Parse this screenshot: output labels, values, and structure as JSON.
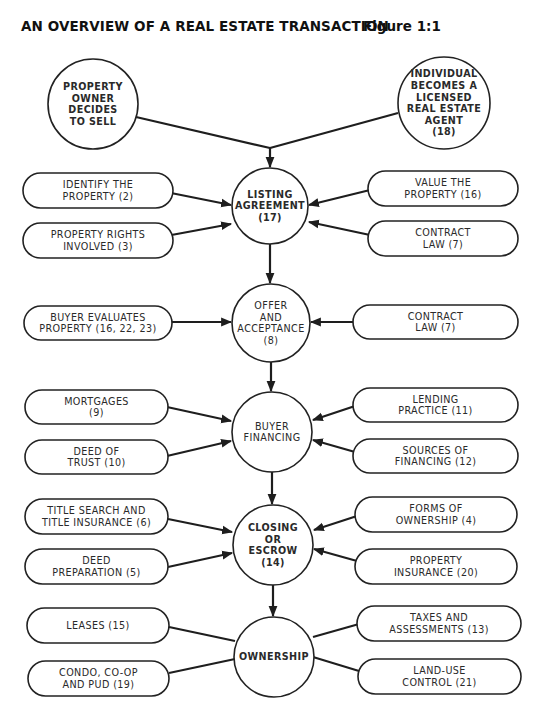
{
  "header": {
    "title": "AN OVERVIEW OF A REAL ESTATE TRANSACTION",
    "figure": "Figure 1:1"
  },
  "colors": {
    "stroke": "#222222",
    "text": "#2a2a2a",
    "background": "#ffffff"
  },
  "circles": [
    {
      "id": "property-owner-decides-to-sell",
      "cx": 93,
      "cy": 104,
      "r": 45,
      "bold": true,
      "lines": [
        "PROPERTY",
        "OWNER",
        "DECIDES",
        "TO SELL"
      ]
    },
    {
      "id": "individual-becomes-licensed-agent",
      "cx": 444,
      "cy": 103,
      "r": 46,
      "bold": true,
      "lines": [
        "INDIVIDUAL",
        "BECOMES A",
        "LICENSED",
        "REAL ESTATE",
        "AGENT",
        "(18)"
      ]
    },
    {
      "id": "listing-agreement",
      "cx": 270,
      "cy": 206,
      "r": 38,
      "bold": true,
      "lines": [
        "LISTING",
        "AGREEMENT",
        "(17)"
      ]
    },
    {
      "id": "offer-and-acceptance",
      "cx": 271,
      "cy": 323,
      "r": 39,
      "bold": false,
      "lines": [
        "OFFER",
        "AND",
        "ACCEPTANCE",
        "(8)"
      ]
    },
    {
      "id": "buyer-financing",
      "cx": 272,
      "cy": 432,
      "r": 40,
      "bold": false,
      "lines": [
        "BUYER",
        "FINANCING"
      ]
    },
    {
      "id": "closing-or-escrow",
      "cx": 273,
      "cy": 545,
      "r": 40,
      "bold": true,
      "lines": [
        "CLOSING",
        "OR",
        "ESCROW",
        "(14)"
      ]
    },
    {
      "id": "ownership",
      "cx": 274,
      "cy": 657,
      "r": 40,
      "bold": true,
      "lines": [
        "OWNERSHIP"
      ]
    }
  ],
  "pills": [
    {
      "id": "identify-the-property",
      "x": 23,
      "y": 173,
      "w": 150,
      "h": 35,
      "lines": [
        "IDENTIFY THE",
        "PROPERTY (2)"
      ]
    },
    {
      "id": "property-rights-involved",
      "x": 23,
      "y": 223,
      "w": 150,
      "h": 35,
      "lines": [
        "PROPERTY RIGHTS",
        "INVOLVED (3)"
      ]
    },
    {
      "id": "value-the-property",
      "x": 368,
      "y": 171,
      "w": 150,
      "h": 35,
      "lines": [
        "VALUE THE",
        "PROPERTY (16)"
      ]
    },
    {
      "id": "contract-law-listing",
      "x": 368,
      "y": 221,
      "w": 150,
      "h": 35,
      "lines": [
        "CONTRACT",
        "LAW (7)"
      ]
    },
    {
      "id": "buyer-evaluates-property",
      "x": 24,
      "y": 306,
      "w": 148,
      "h": 34,
      "lines": [
        "BUYER EVALUATES",
        "PROPERTY (16, 22, 23)"
      ]
    },
    {
      "id": "contract-law-offer",
      "x": 353,
      "y": 305,
      "w": 165,
      "h": 34,
      "lines": [
        "CONTRACT",
        "LAW (7)"
      ]
    },
    {
      "id": "mortgages",
      "x": 25,
      "y": 390,
      "w": 143,
      "h": 34,
      "lines": [
        "MORTGAGES",
        "(9)"
      ]
    },
    {
      "id": "deed-of-trust",
      "x": 25,
      "y": 440,
      "w": 143,
      "h": 34,
      "lines": [
        "DEED OF",
        "TRUST (10)"
      ]
    },
    {
      "id": "lending-practice",
      "x": 353,
      "y": 388,
      "w": 165,
      "h": 34,
      "lines": [
        "LENDING",
        "PRACTICE (11)"
      ]
    },
    {
      "id": "sources-of-financing",
      "x": 353,
      "y": 439,
      "w": 165,
      "h": 34,
      "lines": [
        "SOURCES OF",
        "FINANCING (12)"
      ]
    },
    {
      "id": "title-search-and-title-insurance",
      "x": 25,
      "y": 499,
      "w": 143,
      "h": 35,
      "lines": [
        "TITLE SEARCH AND",
        "TITLE INSURANCE (6)"
      ]
    },
    {
      "id": "deed-preparation",
      "x": 25,
      "y": 549,
      "w": 143,
      "h": 35,
      "lines": [
        "DEED",
        "PREPARATION (5)"
      ]
    },
    {
      "id": "forms-of-ownership",
      "x": 355,
      "y": 497,
      "w": 162,
      "h": 35,
      "lines": [
        "FORMS OF",
        "OWNERSHIP (4)"
      ]
    },
    {
      "id": "property-insurance",
      "x": 355,
      "y": 549,
      "w": 162,
      "h": 35,
      "lines": [
        "PROPERTY",
        "INSURANCE (20)"
      ]
    },
    {
      "id": "leases",
      "x": 27,
      "y": 608,
      "w": 142,
      "h": 35,
      "lines": [
        "LEASES (15)"
      ]
    },
    {
      "id": "condo-co-op-and-pud",
      "x": 28,
      "y": 661,
      "w": 141,
      "h": 35,
      "lines": [
        "CONDO, CO-OP",
        "AND PUD (19)"
      ]
    },
    {
      "id": "taxes-and-assessments",
      "x": 357,
      "y": 606,
      "w": 164,
      "h": 35,
      "lines": [
        "TAXES AND",
        "ASSESSMENTS (13)"
      ]
    },
    {
      "id": "land-use-control",
      "x": 358,
      "y": 659,
      "w": 163,
      "h": 35,
      "lines": [
        "LAND-USE",
        "CONTROL (21)"
      ]
    }
  ],
  "edges": [
    {
      "from": [
        136,
        117
      ],
      "to": [
        270,
        148
      ],
      "arrow": false
    },
    {
      "from": [
        398,
        113
      ],
      "to": [
        270,
        148
      ],
      "arrow": false
    },
    {
      "from": [
        270,
        148
      ],
      "to": [
        270,
        167
      ],
      "arrow": true
    },
    {
      "from": [
        166,
        192
      ],
      "to": [
        231,
        205
      ],
      "arrow": true
    },
    {
      "from": [
        166,
        236
      ],
      "to": [
        231,
        224
      ],
      "arrow": true
    },
    {
      "from": [
        370,
        190
      ],
      "to": [
        309,
        205
      ],
      "arrow": true
    },
    {
      "from": [
        370,
        235
      ],
      "to": [
        309,
        222
      ],
      "arrow": true
    },
    {
      "from": [
        270,
        244
      ],
      "to": [
        270,
        283
      ],
      "arrow": true
    },
    {
      "from": [
        167,
        322
      ],
      "to": [
        231,
        322
      ],
      "arrow": true
    },
    {
      "from": [
        355,
        322
      ],
      "to": [
        311,
        322
      ],
      "arrow": true
    },
    {
      "from": [
        271,
        362
      ],
      "to": [
        271,
        391
      ],
      "arrow": true
    },
    {
      "from": [
        167,
        407
      ],
      "to": [
        231,
        421
      ],
      "arrow": true
    },
    {
      "from": [
        167,
        456
      ],
      "to": [
        231,
        441
      ],
      "arrow": true
    },
    {
      "from": [
        355,
        406
      ],
      "to": [
        313,
        420
      ],
      "arrow": true
    },
    {
      "from": [
        355,
        452
      ],
      "to": [
        313,
        440
      ],
      "arrow": true
    },
    {
      "from": [
        272,
        472
      ],
      "to": [
        272,
        504
      ],
      "arrow": true
    },
    {
      "from": [
        168,
        519
      ],
      "to": [
        232,
        532
      ],
      "arrow": true
    },
    {
      "from": [
        168,
        567
      ],
      "to": [
        232,
        553
      ],
      "arrow": true
    },
    {
      "from": [
        357,
        516
      ],
      "to": [
        314,
        530
      ],
      "arrow": true
    },
    {
      "from": [
        357,
        561
      ],
      "to": [
        314,
        549
      ],
      "arrow": true
    },
    {
      "from": [
        273,
        585
      ],
      "to": [
        273,
        616
      ],
      "arrow": true
    },
    {
      "from": [
        169,
        627
      ],
      "to": [
        235,
        641
      ],
      "arrow": false
    },
    {
      "from": [
        169,
        673
      ],
      "to": [
        235,
        659
      ],
      "arrow": false
    },
    {
      "from": [
        359,
        624
      ],
      "to": [
        313,
        637
      ],
      "arrow": false
    },
    {
      "from": [
        359,
        671
      ],
      "to": [
        313,
        657
      ],
      "arrow": false
    }
  ]
}
